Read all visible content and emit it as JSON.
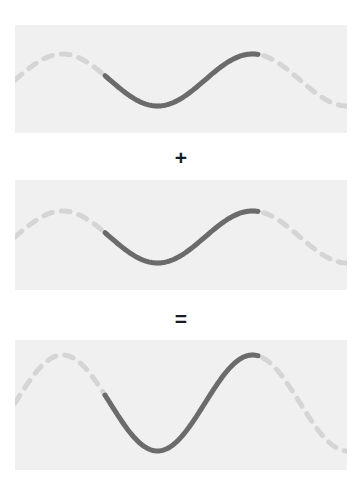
{
  "figure": {
    "title": "",
    "width": 362,
    "height": 478,
    "background_color": "#ffffff"
  },
  "colors": {
    "panel_background": "#f0f0f0",
    "solid_stroke": "#6b6b6b",
    "dashed_stroke": "#d5d5d5",
    "operator_text": "#1b1b1b"
  },
  "operators": [
    {
      "id": "plus",
      "symbol": "+"
    },
    {
      "id": "equal",
      "symbol": "="
    }
  ],
  "panels": [
    {
      "id": "panel-1",
      "label": "first-wave",
      "role": "addend",
      "x": 15,
      "y": 25,
      "width": 332,
      "height": 108,
      "wave": {
        "amplitude": 26,
        "wavelength": 190,
        "phase_deg": 180,
        "midline_y": 55,
        "solid_start_x": 90,
        "solid_end_x": 243,
        "stroke_width": 5
      }
    },
    {
      "id": "panel-2",
      "label": "second-wave",
      "role": "addend",
      "x": 15,
      "y": 180,
      "width": 332,
      "height": 110,
      "wave": {
        "amplitude": 26,
        "wavelength": 190,
        "phase_deg": 180,
        "midline_y": 57,
        "solid_start_x": 90,
        "solid_end_x": 243,
        "stroke_width": 5
      }
    },
    {
      "id": "panel-3",
      "label": "sum-wave",
      "role": "sum",
      "x": 15,
      "y": 340,
      "width": 332,
      "height": 130,
      "wave": {
        "amplitude": 48,
        "wavelength": 190,
        "phase_deg": 180,
        "midline_y": 63,
        "solid_start_x": 90,
        "solid_end_x": 243,
        "stroke_width": 5
      }
    }
  ],
  "chart_data": {
    "type": "line",
    "title": "",
    "subtitle": "",
    "xlabel": "",
    "ylabel": "",
    "grid": false,
    "legend": false,
    "series": [
      {
        "name": "first-wave",
        "panel": "panel-1",
        "form": "sine",
        "amplitude": 1,
        "wavelength": 190,
        "phase_deg": 180,
        "solid_range": [
          90,
          243
        ],
        "style": "solid-center-dashed-ends"
      },
      {
        "name": "second-wave",
        "panel": "panel-2",
        "form": "sine",
        "amplitude": 1,
        "wavelength": 190,
        "phase_deg": 180,
        "solid_range": [
          90,
          243
        ],
        "style": "solid-center-dashed-ends"
      },
      {
        "name": "sum-wave",
        "panel": "panel-3",
        "form": "sine",
        "amplitude": 2,
        "wavelength": 190,
        "phase_deg": 180,
        "solid_range": [
          90,
          243
        ],
        "style": "solid-center-dashed-ends"
      }
    ]
  }
}
